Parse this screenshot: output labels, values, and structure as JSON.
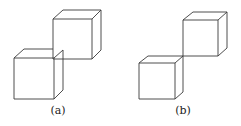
{
  "figures": [
    {
      "label": "(a)",
      "description": "two cubes joined along a vertical edge segment"
    },
    {
      "label": "(b)",
      "description": "two cubes touching at a single vertex"
    }
  ],
  "colors": {
    "stroke": "#3a3a3a",
    "background": "#ffffff"
  }
}
